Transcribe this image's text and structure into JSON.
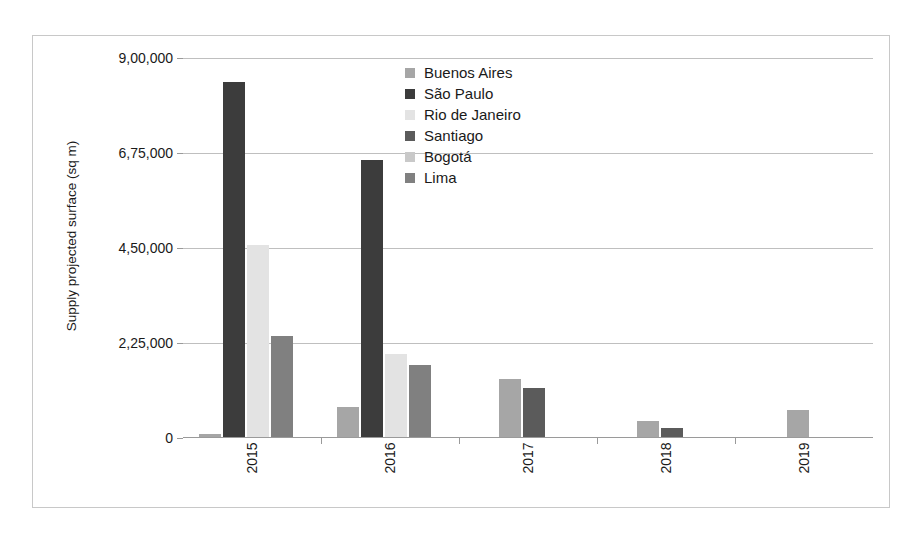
{
  "chart_data": {
    "type": "bar",
    "title": "",
    "subtitle": "",
    "xlabel": "",
    "ylabel": "Supply projected surface (sq m)",
    "categories": [
      "2015",
      "2016",
      "2017",
      "2018",
      "2019"
    ],
    "ylim": [
      0,
      900000
    ],
    "ytick_values": [
      0,
      225000,
      450000,
      675000,
      900000
    ],
    "ytick_labels": [
      "0",
      "2,25,000",
      "4,50,000",
      "6,75,000",
      "9,00,000"
    ],
    "grid": true,
    "legend_position": "inside-top-center",
    "series": [
      {
        "name": "Buenos Aires",
        "color": "#a6a6a6",
        "values": [
          6000,
          70000,
          138000,
          37000,
          65000
        ]
      },
      {
        "name": "São Paulo",
        "color": "#3c3c3c",
        "values": [
          840000,
          655000,
          0,
          0,
          0
        ]
      },
      {
        "name": "Rio de Janeiro",
        "color": "#e3e3e3",
        "values": [
          455000,
          196000,
          0,
          0,
          0
        ]
      },
      {
        "name": "Santiago",
        "color": "#5b5b5b",
        "values": [
          0,
          0,
          115000,
          22000,
          0
        ]
      },
      {
        "name": "Bogotá",
        "color": "#c9c9c9",
        "values": [
          0,
          0,
          0,
          0,
          0
        ]
      },
      {
        "name": "Lima",
        "color": "#808080",
        "values": [
          240000,
          170000,
          0,
          0,
          0
        ]
      }
    ]
  },
  "legend": {
    "items": [
      {
        "label": "Buenos Aires",
        "color": "#a6a6a6"
      },
      {
        "label": "São Paulo",
        "color": "#3c3c3c"
      },
      {
        "label": "Rio de Janeiro",
        "color": "#e3e3e3"
      },
      {
        "label": "Santiago",
        "color": "#5b5b5b"
      },
      {
        "label": "Bogotá",
        "color": "#c9c9c9"
      },
      {
        "label": "Lima",
        "color": "#808080"
      }
    ]
  },
  "axes": {
    "y_title": "Supply projected surface (sq m)",
    "y_tick_labels": [
      "9,00,000",
      "6,75,000",
      "4,50,000",
      "2,25,000",
      "0"
    ],
    "x_tick_labels": [
      "2015",
      "2016",
      "2017",
      "2018",
      "2019"
    ]
  },
  "style": {
    "frame_border_color": "#c8c8c8",
    "gridline_color": "#bfbfbf",
    "axis_color": "#9a9a9a",
    "text_color": "#1a1a1a",
    "background": "#ffffff"
  }
}
